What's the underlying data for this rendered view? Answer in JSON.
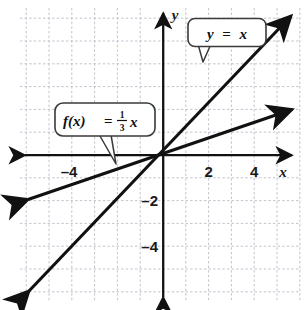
{
  "figure": {
    "kind": "coordinate-plane-line-graph",
    "background_color": "#ffffff",
    "grid_color": "#b9b9c6",
    "axis_color": "#111111",
    "line_color": "#111111"
  },
  "axes": {
    "x_axis_label": "x",
    "y_axis_label": "y",
    "x_tick_labels": [
      "–4",
      "2",
      "4"
    ],
    "y_tick_labels": [
      "4",
      "2",
      "–2",
      "–4"
    ]
  },
  "callouts": [
    {
      "id": "y-equals-x",
      "lhs": "y",
      "operator": "=",
      "rhs": "x"
    },
    {
      "id": "f-of-x",
      "lhs": "f(x)",
      "operator": "=",
      "numerator": "1",
      "denominator": "3",
      "variable": "x"
    }
  ],
  "chart_data": {
    "type": "line",
    "title": "",
    "xlabel": "x",
    "ylabel": "y",
    "xlim": [
      -6.2,
      6.2
    ],
    "ylim": [
      -6.4,
      6.6
    ],
    "grid": true,
    "legend": "callout-labels",
    "series": [
      {
        "name": "y = x",
        "expression": "y = x",
        "slope": 1,
        "intercept": 0,
        "points": [
          [
            -5.9,
            -5.9
          ],
          [
            5.9,
            5.9
          ]
        ],
        "arrows": "both"
      },
      {
        "name": "f(x) = (1/3)x",
        "expression": "f(x) = ⅓x",
        "slope": 0.3333333,
        "intercept": 0,
        "points": [
          [
            -6.0,
            -2.0
          ],
          [
            6.0,
            2.0
          ]
        ],
        "arrows": "both"
      }
    ]
  }
}
